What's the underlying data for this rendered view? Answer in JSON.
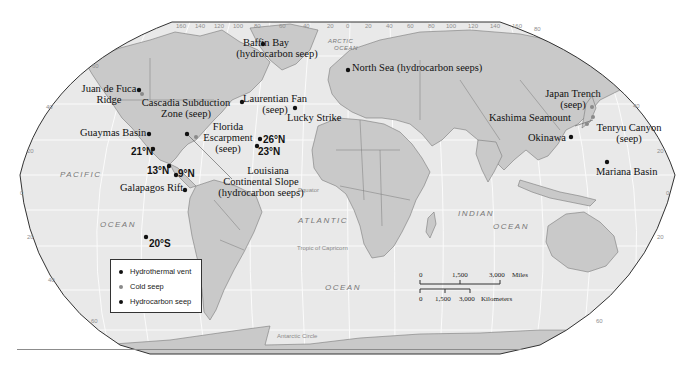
{
  "map": {
    "subject": "World map of hydrothermal vents, cold seeps and hydrocarbon seeps",
    "colors": {
      "ocean": "#e9e9e9",
      "land": "#c9c9c9",
      "land_border": "#7a7a7a",
      "graticule": "#f8f8f8",
      "outline": "#333333",
      "hydrothermal_vent": "#111111",
      "cold_seep": "#8a8a8a",
      "hydrocarbon_seep": "#111111"
    },
    "longitude_ticks": [
      "160",
      "140",
      "120",
      "100",
      "80",
      "60",
      "40",
      "20",
      "0",
      "20",
      "40",
      "60",
      "80",
      "100",
      "120",
      "140",
      "160"
    ],
    "latitude_ticks_left": [
      "60",
      "40",
      "20",
      "0",
      "20",
      "40",
      "60"
    ],
    "latitude_ticks_right": [
      "80",
      "40",
      "20",
      "0",
      "20",
      "60"
    ],
    "degree_symbol": "°",
    "ocean_labels": {
      "arctic_1": "ARCTIC",
      "arctic_2": "OCEAN",
      "pacific": "PACIFIC",
      "pacific_ocean": "OCEAN",
      "atlantic": "ATLANTIC",
      "atlantic_ocean": "OCEAN",
      "indian": "INDIAN",
      "indian_ocean": "OCEAN"
    },
    "geo_lines": {
      "equator": "Equator",
      "tropic_capricorn": "Tropic of Capricorn",
      "antarctic_circle": "Antarctic Circle"
    },
    "sites": [
      {
        "name": "Baffin Bay",
        "sub": "(hydrocarbon seep)",
        "type": "hydrocarbon_seep"
      },
      {
        "name": "North Sea (hydrocarbon seeps)",
        "type": "hydrocarbon_seep"
      },
      {
        "name": "Juan de Fuca",
        "sub": "Ridge",
        "type": "hydrothermal_vent"
      },
      {
        "name": "Cascadia Subduction",
        "sub": "Zone (seep)",
        "type": "cold_seep"
      },
      {
        "name": "Laurentian Fan",
        "sub": "(seep)",
        "type": "cold_seep"
      },
      {
        "name": "Lucky Strike",
        "type": "hydrothermal_vent"
      },
      {
        "name": "Guaymas Basin",
        "type": "hydrothermal_vent"
      },
      {
        "name": "Florida",
        "sub": "Escarpment",
        "sub2": "(seep)",
        "type": "cold_seep"
      },
      {
        "name": "26°N",
        "type": "hydrothermal_vent"
      },
      {
        "name": "23°N",
        "type": "hydrothermal_vent"
      },
      {
        "name": "21°N",
        "type": "hydrothermal_vent"
      },
      {
        "name": "13°N",
        "type": "hydrothermal_vent"
      },
      {
        "name": "9°N",
        "type": "hydrothermal_vent"
      },
      {
        "name": "Louisiana",
        "sub": "Continental Slope",
        "sub2": "(hydrocarbon seeps)",
        "type": "hydrocarbon_seep"
      },
      {
        "name": "Galapagos Rift",
        "type": "hydrothermal_vent"
      },
      {
        "name": "20°S",
        "type": "hydrothermal_vent"
      },
      {
        "name": "Japan Trench",
        "sub": "(seep)",
        "type": "cold_seep"
      },
      {
        "name": "Kashima Seamount",
        "type": "cold_seep"
      },
      {
        "name": "Tenryu Canyon",
        "sub": "(seep)",
        "type": "cold_seep"
      },
      {
        "name": "Okinawa",
        "type": "hydrothermal_vent"
      },
      {
        "name": "Mariana Basin",
        "type": "hydrothermal_vent"
      }
    ]
  },
  "legend": {
    "items": [
      {
        "label": "Hydrothermal vent",
        "color": "#111111"
      },
      {
        "label": "Cold seep",
        "color": "#8a8a8a"
      },
      {
        "label": "Hydrocarbon seep",
        "color": "#111111"
      }
    ]
  },
  "scale_bar": {
    "miles": {
      "ticks": [
        "0",
        "1,500",
        "3,000"
      ],
      "unit": "Miles"
    },
    "kilometers": {
      "ticks": [
        "0",
        "1,500",
        "3,000"
      ],
      "unit": "Kilometers"
    }
  }
}
